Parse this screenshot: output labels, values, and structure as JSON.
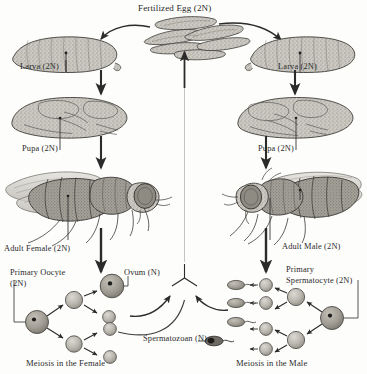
{
  "figure": {
    "organism": "Drosophila melanogaster",
    "style": "stippled pen-and-ink scientific illustration, grayscale"
  },
  "labels": {
    "fertilized_egg": "Fertilized Egg (2N)",
    "larva_female": "Larva (2N)",
    "larva_male": "Larva (2N)",
    "pupa_female": "Pupa (2N)",
    "pupa_male": "Pupa (2N)",
    "adult_female": "Adult Female (2N)",
    "adult_male": "Adult Male (2N)",
    "primary_oocyte": "Primary Oocyte (2N)",
    "primary_spermatocyte": "Primary Spermatocyte (2N)",
    "ovum": "Ovum (N)",
    "spermatozoan": "Spermatozoan (N)",
    "meiosis_female": "Meiosis in the Female",
    "meiosis_male": "Meiosis in the Male"
  },
  "colors": {
    "ink": "#2b2b2b",
    "outline": "#3a3a3a",
    "fill_light": "#cfcdc7",
    "fill_mid": "#b4b1a9",
    "fill_dark": "#8d8a82",
    "cell_light": "#c6c4bd",
    "cell_dark": "#9c998f",
    "background": "#fdfdfc",
    "divider": "#6f6f6f"
  },
  "structure": {
    "branches": [
      {
        "side": "left",
        "sex": "female",
        "stages": [
          "Larva (2N)",
          "Pupa (2N)",
          "Adult Female (2N)",
          "Primary Oocyte (2N)",
          "Ovum (N)"
        ]
      },
      {
        "side": "right",
        "sex": "male",
        "stages": [
          "Larva (2N)",
          "Pupa (2N)",
          "Adult Male (2N)",
          "Primary Spermatocyte (2N)",
          "Spermatozoan (N)"
        ]
      }
    ],
    "cycle_return": "Ovum (N) and Spermatozoan (N) converge upward to Fertilized Egg (2N)"
  },
  "meiosis_female": {
    "caption": "Meiosis in the Female",
    "start_cell": "Primary Oocyte (2N)",
    "products": [
      "Ovum (N)",
      "polar body",
      "polar body",
      "polar body"
    ],
    "product_count": 4,
    "functional_gametes": 1
  },
  "meiosis_male": {
    "caption": "Meiosis in the Male",
    "start_cell": "Primary Spermatocyte (2N)",
    "products": [
      "Spermatozoan (N)",
      "Spermatozoan (N)",
      "Spermatozoan (N)",
      "Spermatozoan (N)"
    ],
    "product_count": 4,
    "functional_gametes": 4
  }
}
